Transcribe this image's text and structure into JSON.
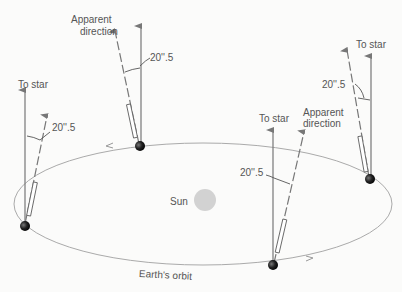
{
  "diagram": {
    "sun_label": "Sun",
    "orbit_label": "Earth's orbit",
    "angle_label": "20''.5",
    "to_star_label": "To star",
    "apparent_label_line1": "Apparent",
    "apparent_label_line2": "direction",
    "positions": [
      {
        "id": "left",
        "labels": [
          "To star",
          "20''.5"
        ]
      },
      {
        "id": "top",
        "labels": [
          "Apparent direction",
          "20''.5"
        ]
      },
      {
        "id": "bottom",
        "labels": [
          "To star",
          "Apparent direction",
          "20''.5"
        ]
      },
      {
        "id": "right",
        "labels": [
          "To star",
          "20''.5"
        ]
      }
    ],
    "colors": {
      "orbit": "#a8a8a8",
      "arrow": "#7a7a7a",
      "sun": "#d3d3d3",
      "earth": "#1a1a1a",
      "text": "#555555"
    }
  }
}
